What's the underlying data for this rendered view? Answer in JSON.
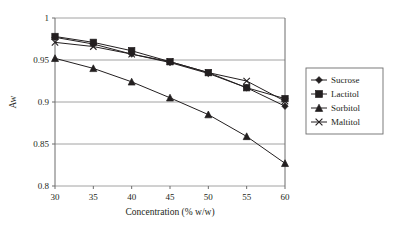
{
  "chart_data": {
    "type": "line",
    "title": "",
    "xlabel": "Concentration (% w/w)",
    "ylabel": "Aw",
    "x": [
      30,
      35,
      40,
      45,
      50,
      55,
      60
    ],
    "xlim": [
      30,
      60
    ],
    "ylim": [
      0.8,
      1
    ],
    "xticks": [
      "30",
      "35",
      "40",
      "45",
      "50",
      "55",
      "60"
    ],
    "yticks": [
      "0.8",
      "0.85",
      "0.9",
      "0.95",
      "1"
    ],
    "ytick_values": [
      0.8,
      0.85,
      0.9,
      0.95,
      1
    ],
    "grid": "horizontal",
    "legend_position": "right-outside",
    "series": [
      {
        "name": "Sucrose",
        "marker": "diamond",
        "color": "#231f20",
        "values": [
          0.977,
          0.969,
          0.957,
          0.947,
          0.934,
          0.917,
          0.895
        ]
      },
      {
        "name": "Lactitol",
        "marker": "square",
        "color": "#231f20",
        "values": [
          0.978,
          0.971,
          0.961,
          0.948,
          0.935,
          0.917,
          0.904
        ]
      },
      {
        "name": "Sorbitol",
        "marker": "triangle",
        "color": "#231f20",
        "values": [
          0.952,
          0.94,
          0.924,
          0.905,
          0.885,
          0.859,
          0.827
        ]
      },
      {
        "name": "Maltitol",
        "marker": "cross",
        "color": "#231f20",
        "values": [
          0.971,
          0.966,
          0.957,
          0.948,
          0.935,
          0.925,
          0.901
        ]
      }
    ]
  }
}
